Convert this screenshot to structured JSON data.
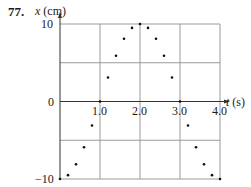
{
  "problem_number": "77.",
  "y_axis": {
    "var": "x",
    "unit": "(cm)"
  },
  "x_axis": {
    "var": "t",
    "unit": "(s)"
  },
  "y_ticks": [
    "10",
    "0",
    "−10"
  ],
  "x_ticks": [
    "1.0",
    "2.0",
    "3.0",
    "4.0"
  ],
  "colors": {
    "grid": "#9a9a9a",
    "axis": "#333333",
    "points": "#111111",
    "text": "#1a1a1a"
  },
  "chart_data": {
    "type": "scatter",
    "title": "",
    "xlabel": "t (s)",
    "ylabel": "x (cm)",
    "xlim": [
      0,
      4.0
    ],
    "ylim": [
      -10,
      10
    ],
    "grid": true,
    "x_ticks": [
      1.0,
      2.0,
      3.0,
      4.0
    ],
    "y_ticks": [
      -10,
      0,
      10
    ],
    "series": [
      {
        "name": "position",
        "x": [
          0,
          0.2,
          0.4,
          0.6,
          0.8,
          1.0,
          1.2,
          1.4,
          1.6,
          1.8,
          2.0,
          2.2,
          2.4,
          2.6,
          2.8,
          3.0,
          3.2,
          3.4,
          3.6,
          3.8,
          4.0
        ],
        "y": [
          -10,
          -9.5,
          -8.1,
          -5.9,
          -3.1,
          0,
          3.1,
          5.9,
          8.1,
          9.5,
          10,
          9.5,
          8.1,
          5.9,
          3.1,
          0,
          -3.1,
          -5.9,
          -8.1,
          -9.5,
          -10
        ]
      }
    ]
  }
}
